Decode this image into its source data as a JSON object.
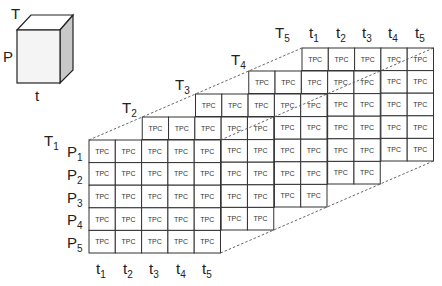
{
  "cube": {
    "labels": {
      "top": "T",
      "left": "P",
      "bottom": "t"
    },
    "colors": {
      "front": "#f4f4f4",
      "top": "#ffffff",
      "side": "#c8c8c8",
      "stroke": "#222222"
    }
  },
  "grid": {
    "cell_label": "TPC",
    "rows": 5,
    "cols": 5,
    "layers": [
      {
        "label": "T",
        "sub": "1"
      },
      {
        "label": "T",
        "sub": "2"
      },
      {
        "label": "T",
        "sub": "3"
      },
      {
        "label": "T",
        "sub": "4"
      },
      {
        "label": "T",
        "sub": "5"
      }
    ],
    "row_labels": [
      {
        "label": "P",
        "sub": "1"
      },
      {
        "label": "P",
        "sub": "2"
      },
      {
        "label": "P",
        "sub": "3"
      },
      {
        "label": "P",
        "sub": "4"
      },
      {
        "label": "P",
        "sub": "5"
      }
    ],
    "col_labels_bottom": [
      {
        "label": "t",
        "sub": "1"
      },
      {
        "label": "t",
        "sub": "2"
      },
      {
        "label": "t",
        "sub": "3"
      },
      {
        "label": "t",
        "sub": "4"
      },
      {
        "label": "t",
        "sub": "5"
      }
    ],
    "col_labels_top": [
      {
        "label": "t",
        "sub": "1"
      },
      {
        "label": "t",
        "sub": "2"
      },
      {
        "label": "t",
        "sub": "3"
      },
      {
        "label": "t",
        "sub": "4"
      },
      {
        "label": "t",
        "sub": "5"
      }
    ]
  }
}
